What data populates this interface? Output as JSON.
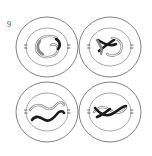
{
  "figure": {
    "label": "9",
    "caption_text": "9",
    "domain": "cell-division-diagram",
    "background_color": "#ffffff",
    "panel_count": 4,
    "grid": {
      "rows": 2,
      "columns": 2
    },
    "colors": {
      "membrane_stroke": "#4a4a4a",
      "nucleus_stroke": "#6a6a6a",
      "chromosome_dark": "#1a1a1a",
      "chromosome_light": "#8a8a8a",
      "centriole_stroke": "#3a3a3a",
      "background": "#ffffff",
      "label_text": "#3a3a3a"
    },
    "panels": [
      {
        "id": "panel-top-left",
        "position": "top-left",
        "cell_center": {
          "x": 47,
          "y": 47
        },
        "membrane_radius": {
          "rx": 31,
          "ry": 30
        },
        "nucleus_radius": {
          "rx": 21,
          "ry": 19
        },
        "chromosome_count": 2,
        "chromosome_styles": [
          "light",
          "dark"
        ],
        "centrioles_visible": true,
        "stage_note": "condensed chromosomes within intact nucleus"
      },
      {
        "id": "panel-top-right",
        "position": "top-right",
        "cell_center": {
          "x": 110,
          "y": 47
        },
        "membrane_radius": {
          "rx": 31,
          "ry": 30
        },
        "nucleus_radius": {
          "rx": 21,
          "ry": 19
        },
        "chromosome_count": 2,
        "chromosome_styles": [
          "light",
          "dark"
        ],
        "centrioles_visible": true,
        "stage_note": "crossed chromosomes within nucleus"
      },
      {
        "id": "panel-bottom-left",
        "position": "bottom-left",
        "cell_center": {
          "x": 47,
          "y": 112
        },
        "membrane_radius": {
          "rx": 31,
          "ry": 30
        },
        "nucleus_radius": {
          "rx": 21,
          "ry": 19
        },
        "chromosome_count": 2,
        "chromosome_styles": [
          "light",
          "dark"
        ],
        "centrioles_visible": true,
        "stage_note": "paired parallel wavy chromosomes"
      },
      {
        "id": "panel-bottom-right",
        "position": "bottom-right",
        "cell_center": {
          "x": 110,
          "y": 112
        },
        "membrane_radius": {
          "rx": 31,
          "ry": 30
        },
        "nucleus_radius": {
          "rx": 21,
          "ry": 19
        },
        "chromosome_count": 2,
        "chromosome_styles": [
          "light",
          "dark"
        ],
        "centrioles_visible": true,
        "stage_note": "overlapping crossed chromosomes"
      }
    ]
  }
}
